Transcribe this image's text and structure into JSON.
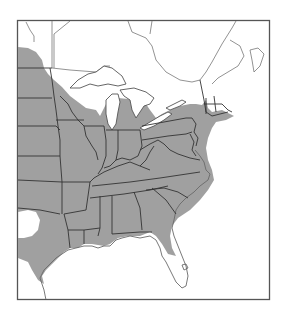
{
  "map": {
    "type": "species range map",
    "region": "Eastern United States and southern Canada",
    "legend": [],
    "colors": {
      "range_fill": "#a0a0a0",
      "background": "#ffffff",
      "frame": "#555555",
      "state_borders": "#333333"
    },
    "range_description": "Shaded range covers the eastern United States from the Great Plains east to the Atlantic coast, north to the Great Lakes and southern New England, south to the Gulf Coast; excludes peninsular Florida, the northern Great Lakes woods, and a gap in western Oklahoma/Texas panhandle"
  }
}
